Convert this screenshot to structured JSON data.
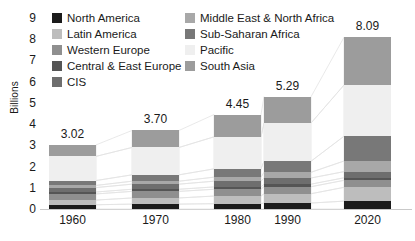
{
  "chart_data": {
    "type": "bar",
    "stacked": true,
    "title": "",
    "subtitle": "",
    "xlabel": "",
    "ylabel": "Billions",
    "categories": [
      "1960",
      "1970",
      "1980",
      "1990",
      "2020"
    ],
    "ylim": [
      0,
      9
    ],
    "yticks": [
      "0",
      "1",
      "2",
      "3",
      "4",
      "5",
      "6",
      "7",
      "8",
      "9"
    ],
    "grid": false,
    "legend_position": "top",
    "totals": [
      "3.02",
      "3.70",
      "4.45",
      "5.29",
      "8.09"
    ],
    "total_values": [
      3.02,
      3.7,
      4.45,
      5.29,
      8.09
    ],
    "series": [
      {
        "name": "North America",
        "color": "#1b1b1b",
        "values": [
          0.2,
          0.23,
          0.25,
          0.28,
          0.37
        ]
      },
      {
        "name": "Latin America",
        "color": "#bdbdbd",
        "values": [
          0.22,
          0.29,
          0.36,
          0.44,
          0.65
        ]
      },
      {
        "name": "Western Europe",
        "color": "#8f8f8f",
        "values": [
          0.29,
          0.31,
          0.32,
          0.33,
          0.33
        ]
      },
      {
        "name": "Central & East Europe",
        "color": "#555555",
        "values": [
          0.09,
          0.1,
          0.11,
          0.12,
          0.12
        ]
      },
      {
        "name": "CIS",
        "color": "#6e6e6e",
        "values": [
          0.21,
          0.24,
          0.27,
          0.29,
          0.29
        ]
      },
      {
        "name": "Middle East & North Africa",
        "color": "#a8a8a8",
        "values": [
          0.1,
          0.14,
          0.19,
          0.27,
          0.5
        ]
      },
      {
        "name": "Sub-Saharan Africa",
        "color": "#787878",
        "values": [
          0.23,
          0.3,
          0.39,
          0.52,
          1.17
        ]
      },
      {
        "name": "Pacific",
        "color": "#efefef",
        "values": [
          1.14,
          1.29,
          1.51,
          1.8,
          2.41
        ]
      },
      {
        "name": "South Asia",
        "color": "#9c9c9c",
        "values": [
          0.54,
          0.8,
          1.05,
          1.24,
          2.25
        ]
      }
    ]
  },
  "legend": {
    "columns": [
      {
        "items": [
          {
            "label": "North America",
            "color": "#1b1b1b"
          },
          {
            "label": "Latin America",
            "color": "#bdbdbd"
          },
          {
            "label": "Western Europe",
            "color": "#8f8f8f"
          },
          {
            "label": "Central & East Europe",
            "color": "#555555"
          },
          {
            "label": "CIS",
            "color": "#6e6e6e"
          }
        ]
      },
      {
        "items": [
          {
            "label": "Middle East & North Africa",
            "color": "#a8a8a8"
          },
          {
            "label": "Sub-Saharan Africa",
            "color": "#787878"
          },
          {
            "label": "Pacific",
            "color": "#efefef"
          },
          {
            "label": "South Asia",
            "color": "#9c9c9c"
          }
        ]
      }
    ]
  },
  "axes": {
    "y_title": "Billions"
  },
  "style": {
    "background": "#ffffff",
    "text_color": "#1a1a1a",
    "ribbon_color": "#e3e3e3",
    "baseline_color": "#c9c9c9"
  }
}
